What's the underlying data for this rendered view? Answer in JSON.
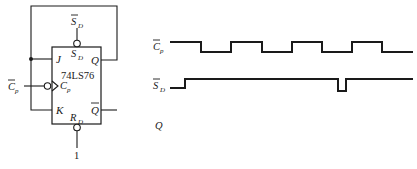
{
  "circuit": {
    "chip_name": "74LS76",
    "pins": {
      "J": "J",
      "K": "K",
      "Q": "Q",
      "Qbar": "Q",
      "Cp": "C",
      "Cp_sub": "p",
      "SD": "S",
      "SD_sub": "D",
      "RD": "R",
      "RD_sub": "D"
    },
    "external_labels": {
      "SD_bar": "S",
      "SD_bar_sub": "D",
      "Cp_bar": "C",
      "Cp_bar_sub": "p",
      "RD_value": "1"
    }
  },
  "waveforms": {
    "signals": [
      {
        "name": "C",
        "sub": "p",
        "overbar": true
      },
      {
        "name": "S",
        "sub": "D",
        "overbar": true
      },
      {
        "name": "Q",
        "sub": "",
        "overbar": false
      }
    ],
    "cp_points": "170,42 201,42 201,52 231,52 231,42 262,42 262,52 292,52 292,42 322,42 322,52 352,52 352,42 382,42 382,52 413,52",
    "sd_points": "170,88 185,88 185,79 338,79 338,91 346,91 346,79 413,79"
  }
}
